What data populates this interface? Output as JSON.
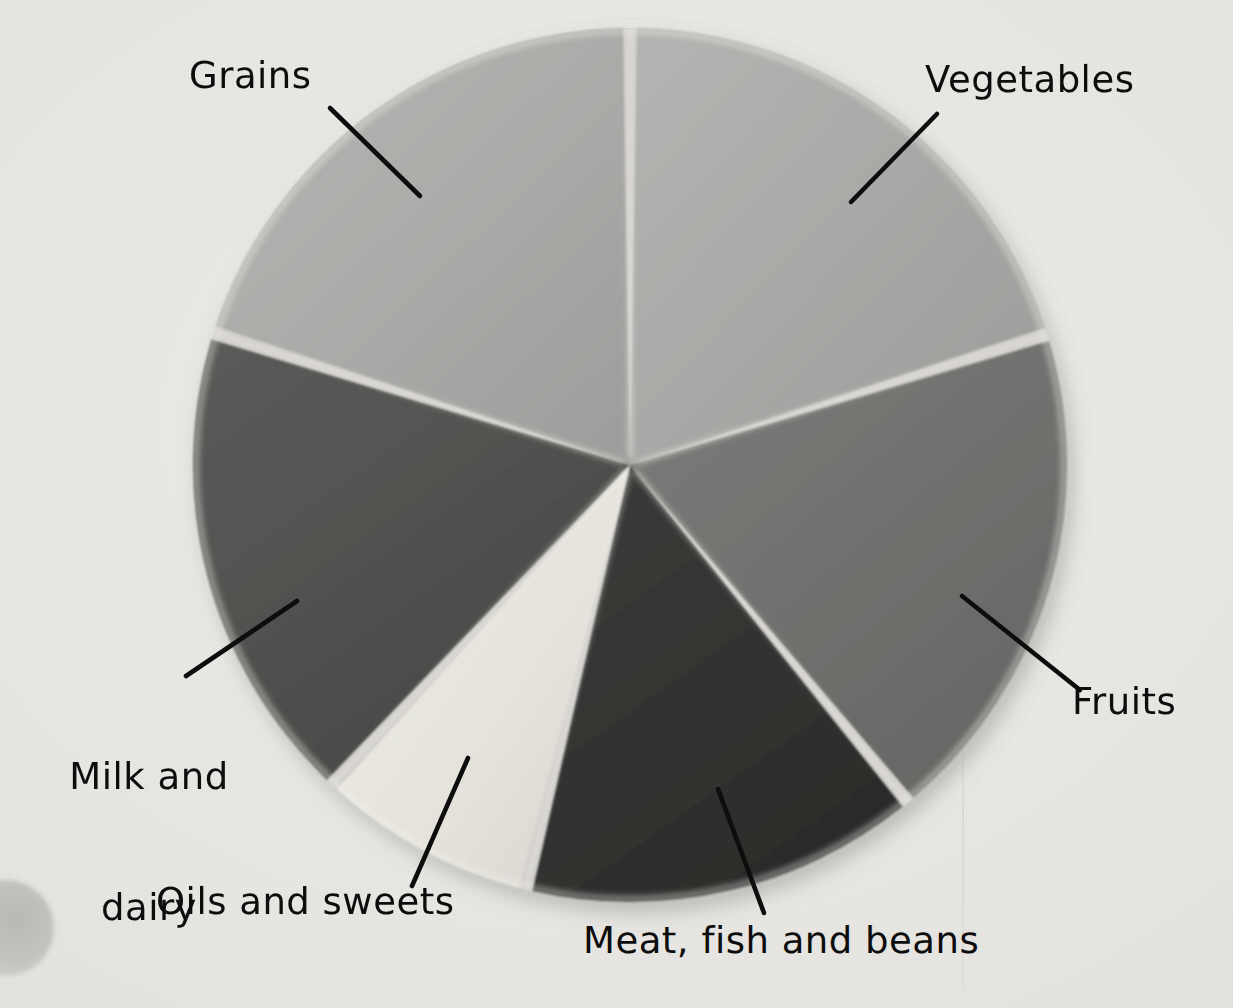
{
  "figure": {
    "kind": "photograph-of-pie-chart",
    "background_color": "#e9e8e4",
    "leader_line_color": "#0d0d0d",
    "label_text_color": "#0d0d0d"
  },
  "chart_data": {
    "type": "pie",
    "title": "",
    "xlabel": "",
    "ylabel": "",
    "legend_position": "none",
    "grid": false,
    "center": {
      "x": 630,
      "y": 465
    },
    "radius": 437,
    "start_angle_deg": 0,
    "direction": "clockwise",
    "categories": [
      "Vegetables",
      "Fruits",
      "Meat, fish and beans",
      "Oils and sweets",
      "Milk and dairy",
      "Grains"
    ],
    "values": [
      20.2,
      18.9,
      14.8,
      8.1,
      17.9,
      20.1
    ],
    "units": "percent",
    "slices": [
      {
        "label": "Vegetables",
        "value": 20.2,
        "start_deg": 0.0,
        "end_deg": 72.6,
        "color": "#a8a8a8",
        "exploded": false
      },
      {
        "label": "Fruits",
        "value": 18.9,
        "start_deg": 72.6,
        "end_deg": 140.5,
        "color": "#6e6e6e",
        "exploded": false
      },
      {
        "label": "Meat, fish and beans",
        "value": 14.8,
        "start_deg": 140.5,
        "end_deg": 193.8,
        "color": "#323232",
        "exploded": false
      },
      {
        "label": "Oils and sweets",
        "value": 8.1,
        "start_deg": 193.8,
        "end_deg": 223.0,
        "color": "#e6e4dd",
        "exploded": false
      },
      {
        "label": "Milk and dairy",
        "value": 17.9,
        "start_deg": 223.0,
        "end_deg": 287.6,
        "color": "#505050",
        "exploded": false
      },
      {
        "label": "Grains",
        "value": 20.1,
        "start_deg": 287.6,
        "end_deg": 360.0,
        "color": "#abab a9",
        "exploded": false
      }
    ]
  },
  "labels": {
    "grains": "Grains",
    "vegetables": "Vegetables",
    "fruits": "Fruits",
    "milk_line1": "Milk and",
    "milk_line2": "dairy",
    "oils": "Oils and sweets",
    "meat": "Meat, fish and beans"
  },
  "leader_lines": [
    {
      "name": "grains-leader",
      "x1": 330,
      "y1": 108,
      "x2": 420,
      "y2": 196
    },
    {
      "name": "vegetables-leader",
      "x1": 851,
      "y1": 202,
      "x2": 937,
      "y2": 114
    },
    {
      "name": "fruits-leader",
      "x1": 962,
      "y1": 596,
      "x2": 1080,
      "y2": 690
    },
    {
      "name": "milk-leader",
      "x1": 186,
      "y1": 676,
      "x2": 297,
      "y2": 601
    },
    {
      "name": "oils-leader",
      "x1": 412,
      "y1": 886,
      "x2": 468,
      "y2": 758
    },
    {
      "name": "meat-leader",
      "x1": 718,
      "y1": 789,
      "x2": 764,
      "y2": 913
    }
  ]
}
